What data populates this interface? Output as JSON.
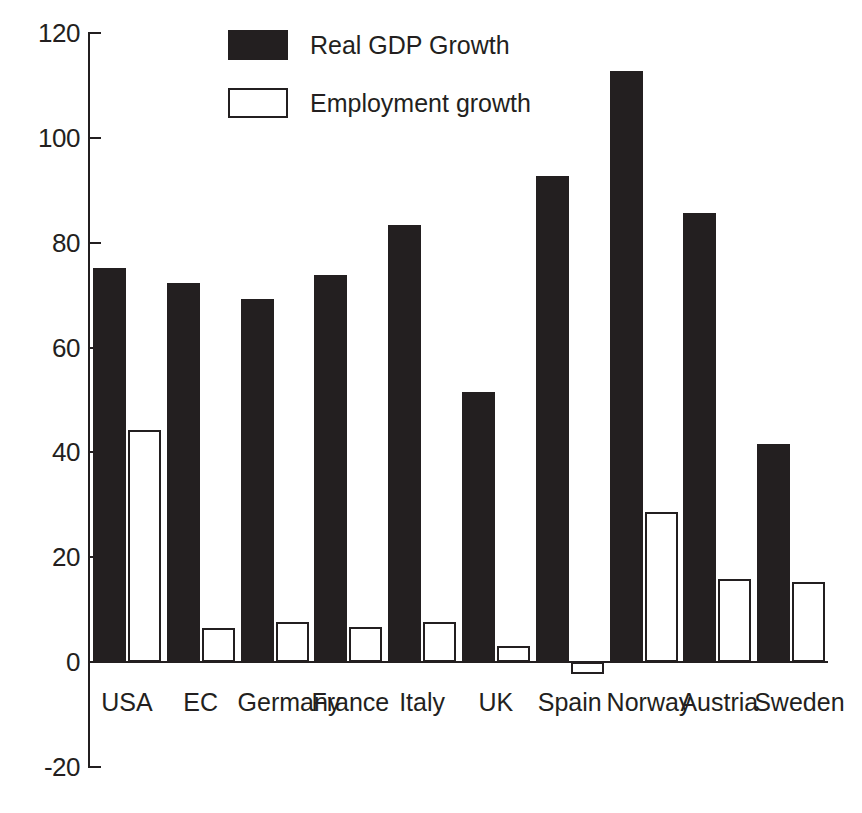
{
  "chart_data": {
    "type": "bar",
    "title": "",
    "subtitle": "",
    "xlabel": "",
    "ylabel": "",
    "ylim": [
      -20,
      120
    ],
    "yticks": [
      120,
      100,
      80,
      60,
      40,
      20,
      0,
      -20
    ],
    "grid": false,
    "legend_position": "top-center",
    "categories": [
      "USA",
      "EC",
      "Germany",
      "France",
      "Italy",
      "UK",
      "Spain",
      "Norway",
      "Austria",
      "Sweden"
    ],
    "series": [
      {
        "name": "Real GDP Growth",
        "style": "filled-black",
        "color": "#231f20",
        "values": [
          75.2,
          72.3,
          69.2,
          73.8,
          83.4,
          51.6,
          92.8,
          112.8,
          85.6,
          41.6
        ]
      },
      {
        "name": "Employment growth",
        "style": "open-white",
        "color": "#ffffff",
        "border_color": "#231f20",
        "values": [
          44.2,
          6.5,
          7.6,
          6.6,
          7.6,
          3.0,
          -2.2,
          28.7,
          15.9,
          15.3
        ]
      }
    ]
  },
  "legend": {
    "items": [
      {
        "label": "Real GDP Growth",
        "swatch": "filled"
      },
      {
        "label": "Employment growth",
        "swatch": "open"
      }
    ]
  },
  "axis": {
    "y_tick_labels": [
      "120",
      "100",
      "80",
      "60",
      "40",
      "20",
      "0",
      "-20"
    ]
  },
  "colors": {
    "ink": "#231f20",
    "paper": "#ffffff"
  }
}
